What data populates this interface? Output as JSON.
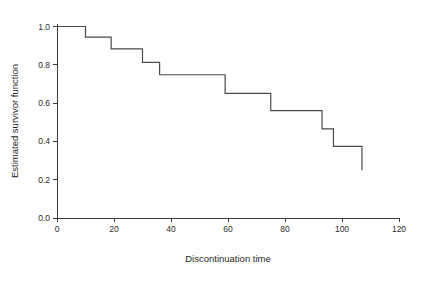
{
  "chart_data": {
    "type": "line",
    "subtype": "kaplan-meier-step",
    "title": "",
    "xlabel": "Discontinuation time",
    "ylabel": "Estimated survivor function",
    "xlim": [
      0,
      120
    ],
    "ylim": [
      0.0,
      1.0
    ],
    "xticks": [
      0,
      20,
      40,
      60,
      80,
      100,
      120
    ],
    "xtick_labels": [
      "0",
      "20",
      "40",
      "60",
      "80",
      "100",
      "120"
    ],
    "yticks": [
      0.0,
      0.2,
      0.4,
      0.6,
      0.8,
      1.0
    ],
    "ytick_labels": [
      "0.0",
      "0.2",
      "0.4",
      "0.6",
      "0.8",
      "1.0"
    ],
    "grid": false,
    "legend": null,
    "line_color": "#4a4a4a",
    "axis_color": "#3a3a3a",
    "background_color": "#ffffff",
    "x": [
      0,
      10,
      10,
      19,
      19,
      30,
      30,
      36,
      36,
      59,
      59,
      75,
      75,
      93,
      93,
      97,
      97,
      107,
      107
    ],
    "y": [
      1.0,
      1.0,
      0.945,
      0.945,
      0.883,
      0.883,
      0.813,
      0.813,
      0.748,
      0.748,
      0.651,
      0.651,
      0.561,
      0.561,
      0.465,
      0.465,
      0.374,
      0.374,
      0.249
    ],
    "steps": [
      {
        "time": 0,
        "survival": 1.0
      },
      {
        "time": 10,
        "survival": 0.945
      },
      {
        "time": 19,
        "survival": 0.883
      },
      {
        "time": 30,
        "survival": 0.813
      },
      {
        "time": 36,
        "survival": 0.748
      },
      {
        "time": 59,
        "survival": 0.651
      },
      {
        "time": 75,
        "survival": 0.561
      },
      {
        "time": 93,
        "survival": 0.465
      },
      {
        "time": 97,
        "survival": 0.374
      },
      {
        "time": 107,
        "survival": 0.249
      }
    ]
  }
}
